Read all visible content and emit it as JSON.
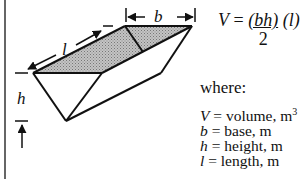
{
  "diagram": {
    "labels": {
      "length": "l",
      "base": "b",
      "height": "h"
    },
    "formula": {
      "lhs": "V",
      "equals": "=",
      "numerator": "(bh)",
      "denominator": "2",
      "factor": "(l)"
    },
    "where_label": "where:",
    "definitions": [
      {
        "symbol": "V",
        "eq": "=",
        "text": "volume, m",
        "sup": "3"
      },
      {
        "symbol": "b",
        "eq": "=",
        "text": "base, m",
        "sup": ""
      },
      {
        "symbol": "h",
        "eq": "=",
        "text": "height, m",
        "sup": ""
      },
      {
        "symbol": "l",
        "eq": "=",
        "text": "length, m",
        "sup": ""
      }
    ],
    "colors": {
      "line": "#111111",
      "shade": "#a8a8a8",
      "border": "#333333"
    }
  }
}
